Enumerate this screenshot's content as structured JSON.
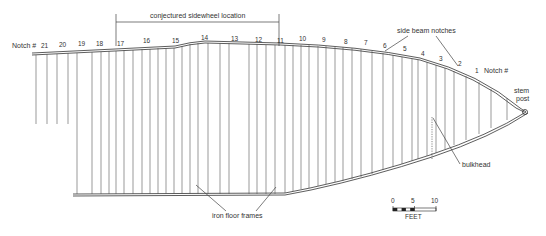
{
  "diagram": {
    "labels": {
      "sidewheel": "conjectured sidewheel location",
      "side_beam_notches": "side beam notches",
      "notch_left": "Notch #",
      "notch_right": "Notch #",
      "stem_post_1": "stem",
      "stem_post_2": "post",
      "bulkhead": "bulkhead",
      "iron_floor_frames": "iron floor frames"
    },
    "notches": [
      {
        "n": "21",
        "x": 45,
        "y": 48
      },
      {
        "n": "20",
        "x": 63,
        "y": 47
      },
      {
        "n": "19",
        "x": 82,
        "y": 46
      },
      {
        "n": "18",
        "x": 100,
        "y": 45
      },
      {
        "n": "17",
        "x": 120,
        "y": 44
      },
      {
        "n": "16",
        "x": 146,
        "y": 42
      },
      {
        "n": "15",
        "x": 176,
        "y": 40
      },
      {
        "n": "14",
        "x": 206,
        "y": 38
      },
      {
        "n": "13",
        "x": 236,
        "y": 39
      },
      {
        "n": "12",
        "x": 259,
        "y": 40
      },
      {
        "n": "11",
        "x": 281,
        "y": 41
      },
      {
        "n": "10",
        "x": 303,
        "y": 40
      },
      {
        "n": "9",
        "x": 324,
        "y": 41
      },
      {
        "n": "8",
        "x": 345,
        "y": 43
      },
      {
        "n": "7",
        "x": 366,
        "y": 44
      },
      {
        "n": "6",
        "x": 385,
        "y": 47
      },
      {
        "n": "5",
        "x": 405,
        "y": 51
      },
      {
        "n": "4",
        "x": 424,
        "y": 55
      },
      {
        "n": "3",
        "x": 441,
        "y": 59
      },
      {
        "n": "2",
        "x": 460,
        "y": 64
      },
      {
        "n": "1",
        "x": 477,
        "y": 71
      }
    ],
    "scale": {
      "ticks": [
        "0",
        "5",
        "10"
      ],
      "unit": "FEET"
    }
  }
}
